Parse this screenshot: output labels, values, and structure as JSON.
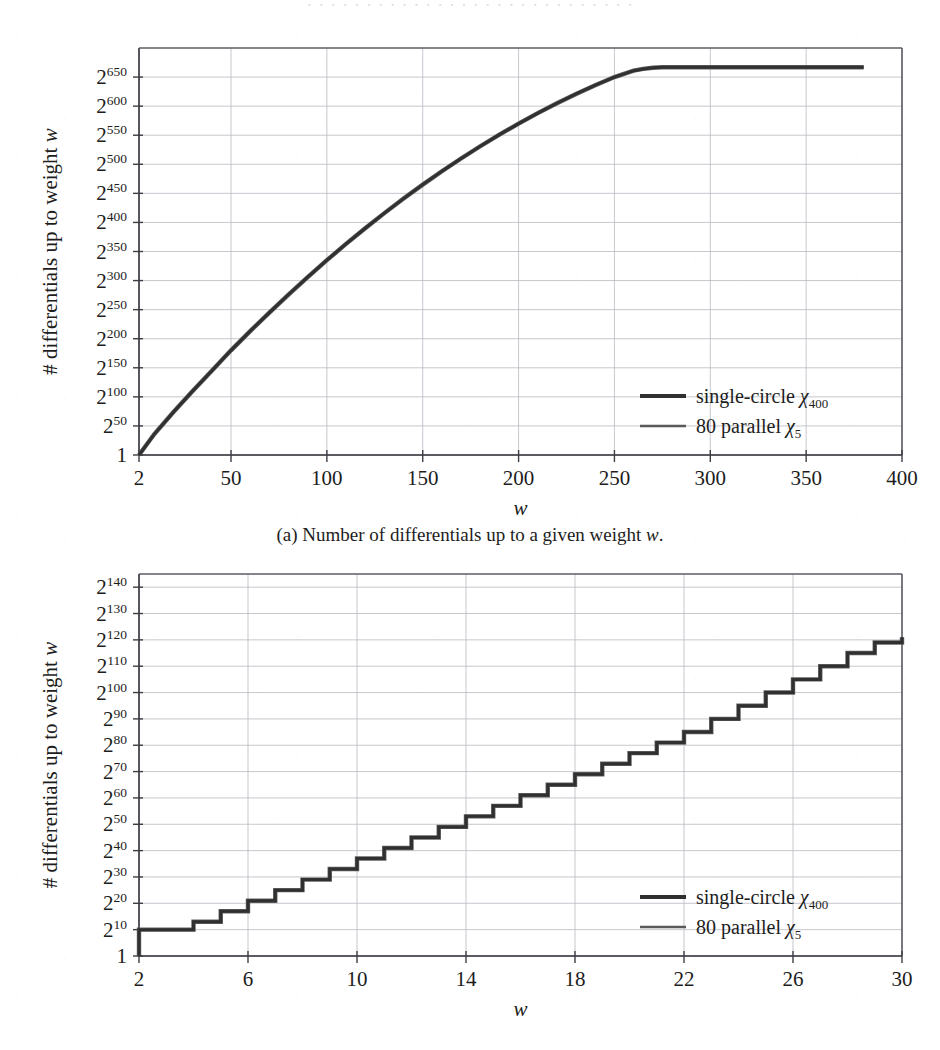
{
  "page": {
    "ghost_top_text": "· · · · · · · · · · · · · · · · · · · · · · · · · · · ·",
    "background_color": "#ffffff",
    "ink_color": "#2b2b2b",
    "grid_color": "#b9b9c2"
  },
  "figure_a": {
    "caption": "(a) Number of differentials up to a given weight w.",
    "caption_prefix": "(a) Number of differentials up to a given weight ",
    "caption_italic": "w",
    "caption_suffix": "."
  },
  "legend": {
    "series_1_label": "single-circle ",
    "series_1_chi": "χ",
    "series_1_sub": "400",
    "series_2_label": "80 parallel ",
    "series_2_chi": "χ",
    "series_2_sub": "5"
  },
  "axis_titles": {
    "y_prefix": "# differentials up to weight ",
    "y_italic": "w",
    "x": "w"
  },
  "chart_data": [
    {
      "id": "chart-a",
      "type": "line",
      "title": "(a) Number of differentials up to a given weight w.",
      "xlabel": "w",
      "ylabel": "# differentials up to weight w",
      "xlim": [
        2,
        400
      ],
      "ylim": [
        0,
        700
      ],
      "yscale": "log2",
      "grid": true,
      "legend_position": "lower-right",
      "xticks": [
        2,
        50,
        100,
        150,
        200,
        250,
        300,
        350,
        400
      ],
      "xtick_labels": [
        "2",
        "50",
        "100",
        "150",
        "200",
        "250",
        "300",
        "350",
        "400"
      ],
      "yticks": [
        0,
        50,
        100,
        150,
        200,
        250,
        300,
        350,
        400,
        450,
        500,
        550,
        600,
        650
      ],
      "ytick_labels": [
        "1",
        "2^50",
        "2^100",
        "2^150",
        "2^200",
        "2^250",
        "2^300",
        "2^350",
        "2^400",
        "2^450",
        "2^500",
        "2^550",
        "2^600",
        "2^650"
      ],
      "ytick_bases": [
        "1",
        "2",
        "2",
        "2",
        "2",
        "2",
        "2",
        "2",
        "2",
        "2",
        "2",
        "2",
        "2",
        "2"
      ],
      "ytick_exps": [
        "",
        "50",
        "100",
        "150",
        "200",
        "250",
        "300",
        "350",
        "400",
        "450",
        "500",
        "550",
        "600",
        "650"
      ],
      "series": [
        {
          "name": "single-circle χ400",
          "color": "#303030",
          "x": [
            2,
            10,
            20,
            30,
            40,
            50,
            60,
            70,
            80,
            90,
            100,
            110,
            120,
            130,
            140,
            150,
            160,
            170,
            180,
            190,
            200,
            210,
            220,
            230,
            240,
            250,
            260,
            265,
            270,
            275,
            280,
            290,
            300,
            320,
            340,
            360,
            380,
            400
          ],
          "y": [
            0,
            36,
            74,
            110,
            145,
            180,
            213,
            245,
            276,
            306,
            335,
            363,
            390,
            416,
            441,
            465,
            488,
            510,
            531,
            551,
            570,
            588,
            605,
            621,
            636,
            650,
            661,
            664,
            666,
            667,
            667,
            667,
            667,
            667,
            667,
            667,
            667
          ]
        },
        {
          "name": "80 parallel χ5",
          "color": "#5a5a5a",
          "x": [
            2,
            10,
            20,
            30,
            40,
            50,
            60,
            70,
            80,
            90,
            100,
            110,
            120,
            130,
            140,
            150,
            160,
            170,
            180,
            190,
            200,
            210,
            220,
            230,
            240,
            250,
            260,
            265,
            270,
            275,
            280,
            290,
            300,
            320,
            340,
            360,
            380,
            400
          ],
          "y": [
            0,
            36,
            74,
            110,
            145,
            180,
            213,
            245,
            276,
            306,
            335,
            363,
            390,
            416,
            441,
            465,
            488,
            510,
            531,
            551,
            570,
            588,
            605,
            621,
            636,
            650,
            661,
            664,
            666,
            667,
            667,
            667,
            667,
            667,
            667,
            667,
            667
          ]
        }
      ]
    },
    {
      "id": "chart-b",
      "type": "line",
      "title": "",
      "xlabel": "w",
      "ylabel": "# differentials up to weight w",
      "xlim": [
        2,
        30
      ],
      "ylim": [
        0,
        145
      ],
      "yscale": "log2",
      "grid": true,
      "legend_position": "lower-right",
      "step": "post",
      "xticks": [
        2,
        6,
        10,
        14,
        18,
        22,
        26,
        30
      ],
      "xtick_labels": [
        "2",
        "6",
        "10",
        "14",
        "18",
        "22",
        "26",
        "30"
      ],
      "yticks": [
        0,
        10,
        20,
        30,
        40,
        50,
        60,
        70,
        80,
        90,
        100,
        110,
        120,
        130,
        140
      ],
      "ytick_labels": [
        "1",
        "2^10",
        "2^20",
        "2^30",
        "2^40",
        "2^50",
        "2^60",
        "2^70",
        "2^80",
        "2^90",
        "2^100",
        "2^110",
        "2^120",
        "2^130",
        "2^140"
      ],
      "ytick_bases": [
        "1",
        "2",
        "2",
        "2",
        "2",
        "2",
        "2",
        "2",
        "2",
        "2",
        "2",
        "2",
        "2",
        "2",
        "2"
      ],
      "ytick_exps": [
        "",
        "10",
        "20",
        "30",
        "40",
        "50",
        "60",
        "70",
        "80",
        "90",
        "100",
        "110",
        "120",
        "130",
        "140"
      ],
      "series": [
        {
          "name": "single-circle χ400",
          "color": "#303030",
          "x": [
            2,
            3,
            4,
            5,
            6,
            7,
            8,
            9,
            10,
            11,
            12,
            13,
            14,
            15,
            16,
            17,
            18,
            19,
            20,
            21,
            22,
            23,
            24,
            25,
            26,
            27,
            28,
            29,
            30
          ],
          "y": [
            10,
            10,
            13,
            17,
            21,
            25,
            29,
            33,
            37,
            41,
            45,
            49,
            53,
            57,
            61,
            65,
            69,
            73,
            77,
            81,
            85,
            90,
            95,
            100,
            105,
            110,
            115,
            119,
            121
          ]
        },
        {
          "name": "80 parallel χ5",
          "color": "#5a5a5a",
          "x": [
            2,
            3,
            4,
            5,
            6,
            7,
            8,
            9,
            10,
            11,
            12,
            13,
            14,
            15,
            16,
            17,
            18,
            19,
            20,
            21,
            22,
            23,
            24,
            25,
            26,
            27,
            28,
            29,
            30
          ],
          "y": [
            10,
            10,
            13,
            17,
            21,
            25,
            29,
            33,
            37,
            41,
            45,
            49,
            53,
            57,
            61,
            65,
            69,
            73,
            77,
            81,
            85,
            90,
            95,
            100,
            105,
            110,
            115,
            119,
            121
          ]
        }
      ]
    }
  ]
}
